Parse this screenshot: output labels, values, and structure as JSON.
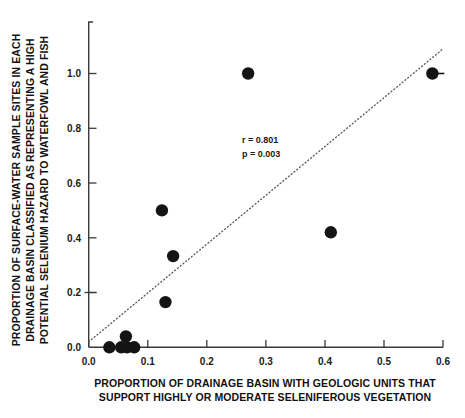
{
  "chart_data": {
    "type": "scatter",
    "title": "",
    "xlabel": "PROPORTION OF DRAINAGE BASIN WITH GEOLOGIC UNITS THAT SUPPORT HIGHLY OR MODERATE SELENIFEROUS VEGETATION",
    "ylabel": "PROPORTION OF SURFACE-WATER SAMPLE SITES IN EACH DRAINAGE BASIN CLASSIFIED AS REPRESENTING A HIGH POTENTIAL SELENIUM HAZARD TO WATERFOWL AND FISH",
    "xlabel_lines": [
      "PROPORTION OF DRAINAGE BASIN WITH GEOLOGIC UNITS THAT",
      "SUPPORT HIGHLY OR MODERATE SELENIFEROUS VEGETATION"
    ],
    "ylabel_lines": [
      "PROPORTION OF SURFACE-WATER SAMPLE SITES IN EACH",
      "DRAINAGE BASIN CLASSIFIED AS REPRESENTING A HIGH",
      "POTENTIAL SELENIUM HAZARD TO WATERFOWL AND FISH"
    ],
    "xlim": [
      0.0,
      0.6
    ],
    "ylim": [
      0.0,
      1.18
    ],
    "xticks": [
      0.0,
      0.1,
      0.2,
      0.3,
      0.4,
      0.5,
      0.6
    ],
    "xtick_labels": [
      "0.0",
      "0.1",
      "0.2",
      "0.3",
      "0.4",
      "0.5",
      "0.6"
    ],
    "yticks": [
      0.0,
      0.2,
      0.4,
      0.6,
      0.8,
      1.0
    ],
    "ytick_labels": [
      "0.0",
      "0.2",
      "0.4",
      "0.6",
      "0.8",
      "1.0"
    ],
    "grid": false,
    "legend": "none",
    "points": [
      {
        "x": 0.035,
        "y": 0.0
      },
      {
        "x": 0.055,
        "y": 0.0
      },
      {
        "x": 0.063,
        "y": 0.04
      },
      {
        "x": 0.065,
        "y": 0.0
      },
      {
        "x": 0.077,
        "y": 0.0
      },
      {
        "x": 0.124,
        "y": 0.5
      },
      {
        "x": 0.13,
        "y": 0.165
      },
      {
        "x": 0.143,
        "y": 0.333
      },
      {
        "x": 0.27,
        "y": 1.0
      },
      {
        "x": 0.41,
        "y": 0.42
      },
      {
        "x": 0.582,
        "y": 1.0
      }
    ],
    "trend_line": {
      "style": "dotted",
      "x_start": 0.0,
      "y_start": 0.02,
      "x_end": 0.6,
      "y_end": 1.09
    },
    "annotations": {
      "r_label": "r = 0.801",
      "p_label": "p = 0.003",
      "r_value": 0.801,
      "p_value": 0.003
    },
    "colors": {
      "point": "#141414",
      "axis": "#3a3a3a",
      "trend": "#555555",
      "background": "#ffffff"
    }
  }
}
